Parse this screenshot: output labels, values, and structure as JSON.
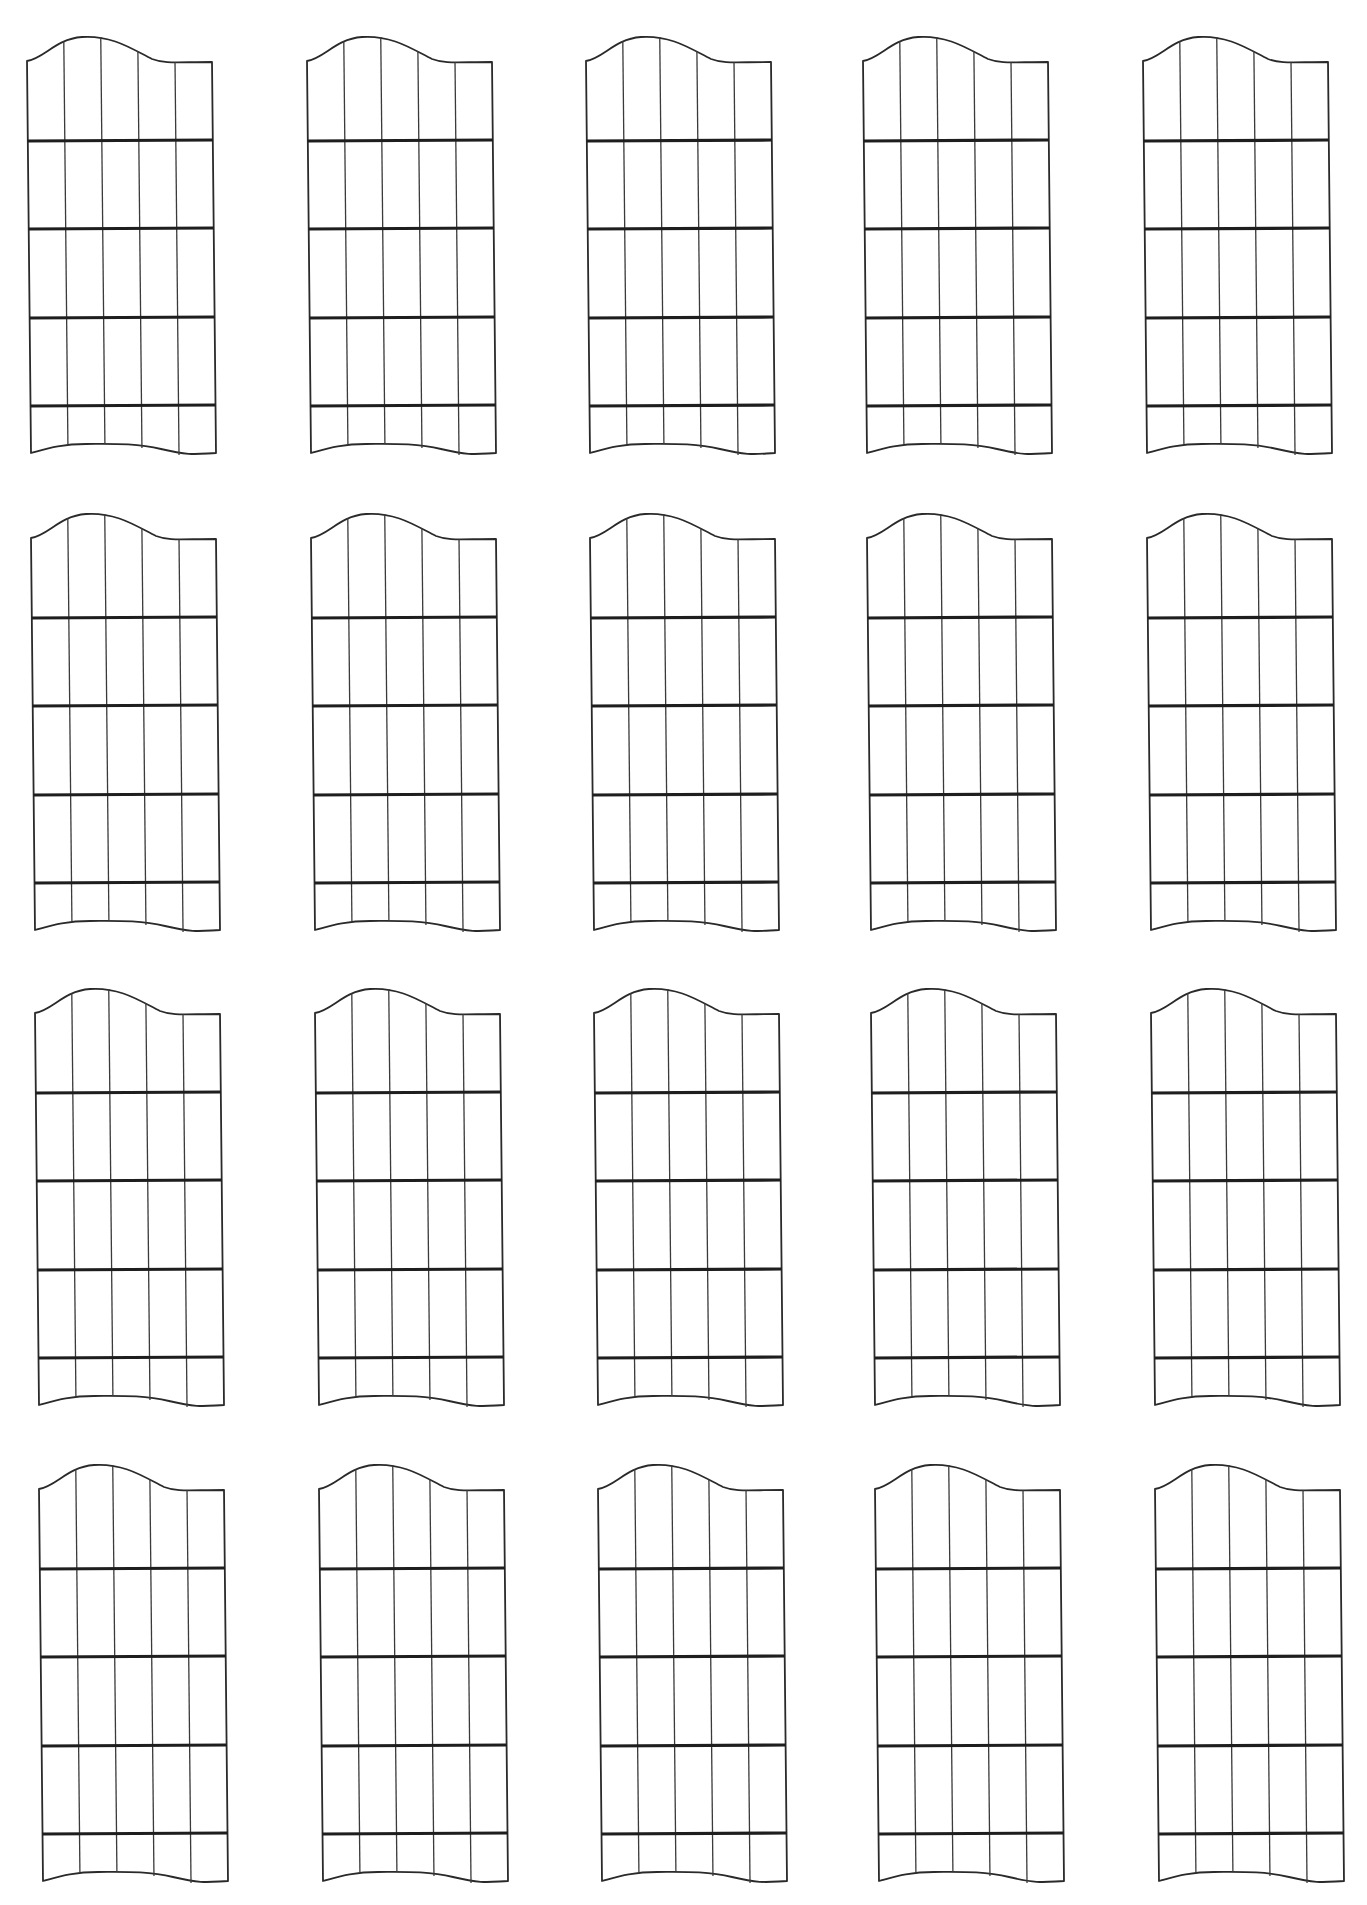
{
  "document": {
    "type": "blank fretboard diagram worksheet",
    "rows": 4,
    "columns": 5,
    "diagram_count": 20,
    "diagram": {
      "strings": 6,
      "fret_lines": 4,
      "fret_spaces": 5
    },
    "colors": {
      "background": "#ffffff",
      "line": "#2a2a2a",
      "fret": "#1e1e1e"
    }
  }
}
